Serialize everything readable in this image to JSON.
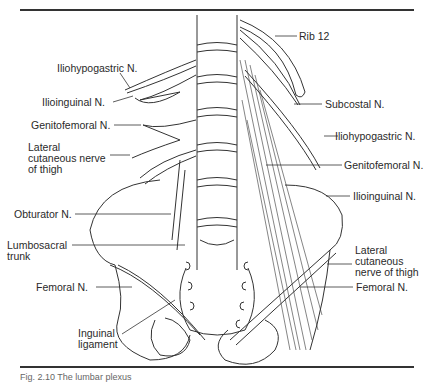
{
  "figure": {
    "caption": "Fig. 2.10 The lumbar plexus",
    "left_labels": [
      {
        "id": "iliohypogastric",
        "text": "Iliohypogastric N."
      },
      {
        "id": "ilioinguinal",
        "text": "Ilioinguinal N."
      },
      {
        "id": "genitofemoral",
        "text": "Genitofemoral N."
      },
      {
        "id": "lateral-cutaneous",
        "text": "Lateral\ncutaneous nerve\nof thigh"
      },
      {
        "id": "obturator",
        "text": "Obturator N."
      },
      {
        "id": "lumbosacral-trunk",
        "text": "Lumbosacral\ntrunk"
      },
      {
        "id": "femoral",
        "text": "Femoral N."
      },
      {
        "id": "inguinal-ligament",
        "text": "Inguinal\nligament"
      }
    ],
    "right_labels": [
      {
        "id": "rib12",
        "text": "Rib 12"
      },
      {
        "id": "subcostal",
        "text": "Subcostal N."
      },
      {
        "id": "iliohypogastric",
        "text": "Iliohypogastric N."
      },
      {
        "id": "genitofemoral",
        "text": "Genitofemoral N."
      },
      {
        "id": "ilioinguinal",
        "text": "Ilioinguinal N."
      },
      {
        "id": "lateral-cutaneous",
        "text": "Lateral\ncutaneous\nnerve of thigh"
      },
      {
        "id": "femoral",
        "text": "Femoral N."
      }
    ]
  }
}
